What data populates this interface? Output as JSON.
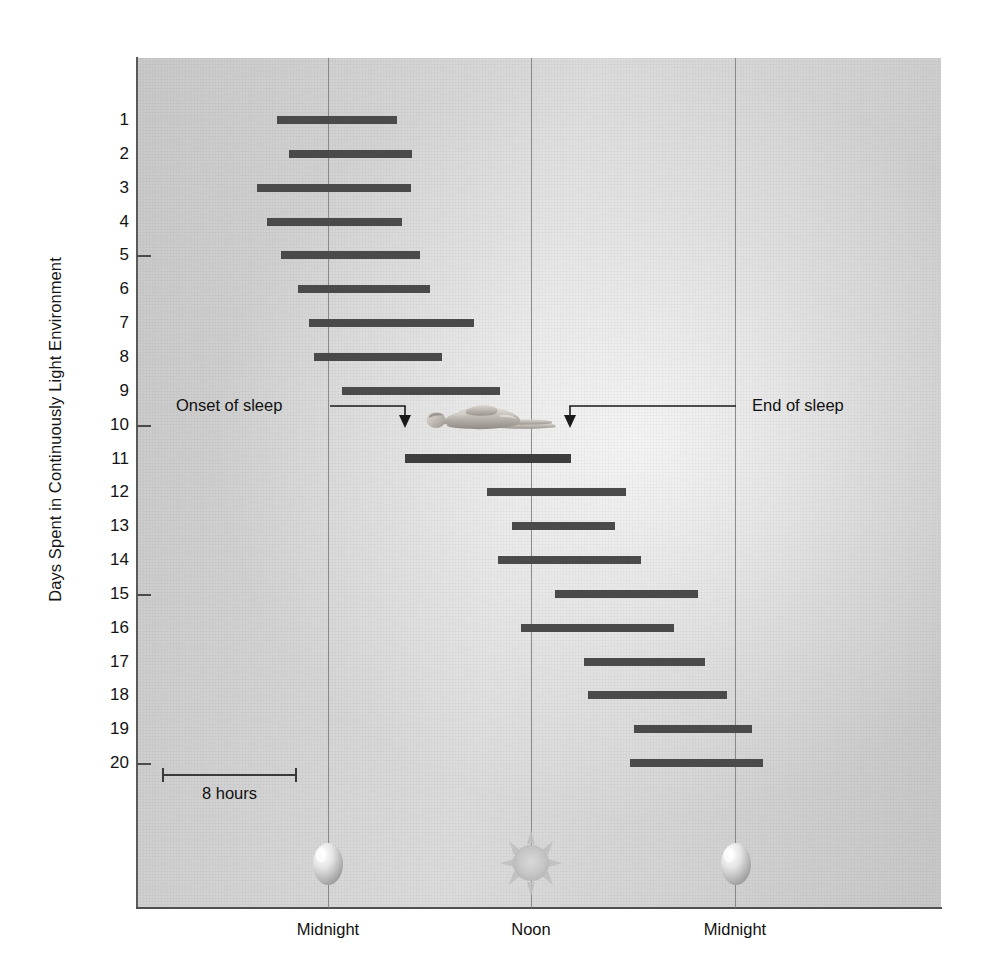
{
  "chart_data": {
    "type": "bar",
    "title": "",
    "subtitle": "",
    "ylabel": "Days Spent in Continuously Light Environment",
    "xlabel": "",
    "x_tick_labels": [
      "Midnight",
      "Noon",
      "Midnight"
    ],
    "x_tick_hours": [
      0,
      12,
      24
    ],
    "xlim": [
      -3.2,
      23.6
    ],
    "ylim": [
      0.4,
      24.0
    ],
    "y_tick_labels": [
      "5",
      "10",
      "15",
      "20"
    ],
    "y_ticks": [
      5,
      10,
      15,
      20
    ],
    "grid": "vertical gridlines at Midnight, Noon, Midnight",
    "legend": "none",
    "bar_color": "#4a4a4a",
    "plot_background": "#d4d4d4",
    "categories": [
      "1",
      "2",
      "3",
      "4",
      "5",
      "6",
      "7",
      "8",
      "9",
      "10",
      "11",
      "12",
      "13",
      "14",
      "15",
      "16",
      "17",
      "18",
      "19",
      "20"
    ],
    "series": [
      {
        "name": "Sleep episode (free-running rhythm)",
        "units": "hours of day (0 = Midnight, 12 = Noon, 24 = Midnight)",
        "bars": [
          {
            "day": 1,
            "start": -3.02,
            "end": 4.08,
            "duration": 7.1
          },
          {
            "day": 2,
            "start": -2.31,
            "end": 4.97,
            "duration": 7.28
          },
          {
            "day": 3,
            "start": -4.2,
            "end": 4.91,
            "duration": 9.11
          },
          {
            "day": 4,
            "start": -3.61,
            "end": 4.38,
            "duration": 7.99
          },
          {
            "day": 5,
            "start": -2.78,
            "end": 5.44,
            "duration": 8.22
          },
          {
            "day": 6,
            "start": -1.78,
            "end": 6.03,
            "duration": 7.81
          },
          {
            "day": 7,
            "start": -1.12,
            "end": 8.63,
            "duration": 9.75
          },
          {
            "day": 8,
            "start": -0.83,
            "end": 6.74,
            "duration": 7.57
          },
          {
            "day": 9,
            "start": 0.83,
            "end": 10.17,
            "duration": 9.34
          },
          {
            "day": 10,
            "start": 4.56,
            "end": 14.32,
            "duration": 9.76
          },
          {
            "day": 11,
            "start": 5.44,
            "end": 12.54,
            "duration": 7.1
          },
          {
            "day": 12,
            "start": 9.41,
            "end": 17.57,
            "duration": 8.16
          },
          {
            "day": 13,
            "start": 10.88,
            "end": 16.92,
            "duration": 6.04
          },
          {
            "day": 14,
            "start": 10.0,
            "end": 18.46,
            "duration": 8.46
          },
          {
            "day": 15,
            "start": 13.37,
            "end": 21.83,
            "duration": 8.46
          },
          {
            "day": 16,
            "start": 11.36,
            "end": 20.41,
            "duration": 9.05
          },
          {
            "day": 17,
            "start": 15.09,
            "end": 22.25,
            "duration": 7.16
          },
          {
            "day": 18,
            "start": 15.33,
            "end": 23.55,
            "duration": 8.22
          },
          {
            "day": 19,
            "start": 18.05,
            "end": 25.04,
            "duration": 6.99
          },
          {
            "day": 20,
            "start": 17.81,
            "end": 25.68,
            "duration": 7.87
          }
        ]
      }
    ],
    "annotations": [
      {
        "name": "onset-of-sleep",
        "text": "Onset of sleep",
        "points_to_day": 10,
        "points_to_hour": 4.56
      },
      {
        "name": "end-of-sleep",
        "text": "End of sleep",
        "points_to_day": 10,
        "points_to_hour": 14.32
      }
    ],
    "scale_bar": {
      "label": "8 hours",
      "hours": 8
    }
  },
  "axis": {
    "y_title": "Days Spent in Continuously Light Environment",
    "y_labels": [
      "1",
      "2",
      "3",
      "4",
      "5",
      "6",
      "7",
      "8",
      "9",
      "10",
      "11",
      "12",
      "13",
      "14",
      "15",
      "16",
      "17",
      "18",
      "19",
      "20"
    ],
    "x_labels": [
      "Midnight",
      "Noon",
      "Midnight"
    ]
  },
  "annotations": {
    "onset_label": "Onset of sleep",
    "end_label": "End of sleep"
  },
  "scale": {
    "label": "8 hours"
  },
  "icons": {
    "moon_left": "moon-icon",
    "sun": "sun-icon",
    "moon_right": "moon-icon",
    "sleeper": "sleeping-person-icon"
  },
  "colors": {
    "bar": "#4a4a4a",
    "gridline": "#7d7d7d",
    "axis": "#4f4f4f",
    "plot_bg": "#d4d4d4",
    "text": "#111111"
  }
}
